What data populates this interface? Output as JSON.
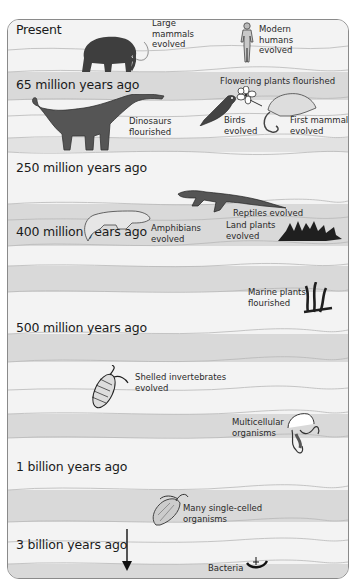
{
  "diagram": {
    "type": "geologic-timeline",
    "orientation": "top-present-bottom-oldest",
    "colors": {
      "light_band": "#f3f3f3",
      "dark_band": "#d9d9d9",
      "border": "#8a8a8a",
      "text": "#1a1a1a"
    },
    "eras": [
      {
        "label": "Present"
      },
      {
        "label": "65 million years ago"
      },
      {
        "label": "250 million years ago"
      },
      {
        "label": "400 million years ago"
      },
      {
        "label": "500 million years ago"
      },
      {
        "label": "1 billion years ago"
      },
      {
        "label": "3 billion years ago"
      }
    ],
    "events": [
      {
        "label": "Large mammals evolved",
        "lines": [
          "Large",
          "mammals",
          "evolved"
        ],
        "icon": "mammoth-icon"
      },
      {
        "label": "Modern humans evolved",
        "lines": [
          "Modern",
          "humans",
          "evolved"
        ],
        "icon": "human-icon"
      },
      {
        "label": "Flowering plants flourished",
        "lines": [
          "Flowering plants flourished"
        ],
        "icon": "flower-icon"
      },
      {
        "label": "Dinosaurs flourished",
        "lines": [
          "Dinosaurs",
          "flourished"
        ],
        "icon": "dinosaur-icon"
      },
      {
        "label": "Birds evolved",
        "lines": [
          "Birds",
          "evolved"
        ],
        "icon": "bird-icon"
      },
      {
        "label": "First mammals evolved",
        "lines": [
          "First mammals",
          "evolved"
        ],
        "icon": "opossum-icon"
      },
      {
        "label": "Reptiles evolved",
        "lines": [
          "Reptiles evolved"
        ],
        "icon": "reptile-icon"
      },
      {
        "label": "Amphibians evolved",
        "lines": [
          "Amphibians",
          "evolved"
        ],
        "icon": "amphibian-icon"
      },
      {
        "label": "Land plants evolved",
        "lines": [
          "Land plants",
          "evolved"
        ],
        "icon": "land-plant-icon"
      },
      {
        "label": "Marine plants flourished",
        "lines": [
          "Marine plants",
          "flourished"
        ],
        "icon": "seaweed-icon"
      },
      {
        "label": "Shelled invertebrates evolved",
        "lines": [
          "Shelled invertebrates",
          "evolved"
        ],
        "icon": "trilobite-icon"
      },
      {
        "label": "Multicellular organisms",
        "lines": [
          "Multicellular",
          "organisms"
        ],
        "icon": "jellyfish-icon"
      },
      {
        "label": "Many single-celled organisms",
        "lines": [
          "Many single-celled",
          "organisms"
        ],
        "icon": "protist-icon"
      },
      {
        "label": "Bacteria",
        "lines": [
          "Bacteria"
        ],
        "icon": "bacteria-icon"
      }
    ]
  }
}
